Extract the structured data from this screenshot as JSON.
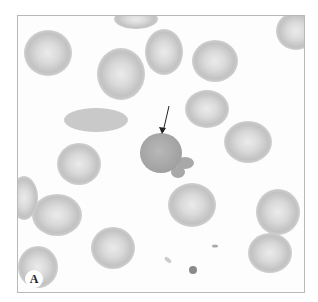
{
  "figure": {
    "panel_label": "A",
    "colors": {
      "background": "#fdfdfd",
      "cell_fill": "#c4c4c4",
      "cell_center": "#e6e6e6",
      "dark_cell": "#a8a8a8",
      "arrow": "#222222",
      "border": "#b8b8b8"
    },
    "cells": [
      {
        "cx": 30,
        "cy": 37,
        "rx": 24,
        "ry": 23,
        "type": "normal"
      },
      {
        "cx": 103,
        "cy": 58,
        "rx": 24,
        "ry": 26,
        "type": "normal"
      },
      {
        "cx": 146,
        "cy": 36,
        "rx": 19,
        "ry": 23,
        "type": "normal"
      },
      {
        "cx": 197,
        "cy": 45,
        "rx": 23,
        "ry": 21,
        "type": "normal"
      },
      {
        "cx": 278,
        "cy": 15,
        "rx": 20,
        "ry": 19,
        "type": "normal"
      },
      {
        "cx": 118,
        "cy": 3,
        "rx": 22,
        "ry": 10,
        "type": "normal"
      },
      {
        "cx": 78,
        "cy": 104,
        "rx": 32,
        "ry": 12,
        "type": "elongated"
      },
      {
        "cx": 189,
        "cy": 93,
        "rx": 22,
        "ry": 19,
        "type": "normal"
      },
      {
        "cx": 230,
        "cy": 126,
        "rx": 24,
        "ry": 21,
        "type": "normal"
      },
      {
        "cx": 61,
        "cy": 148,
        "rx": 22,
        "ry": 21,
        "type": "normal"
      },
      {
        "cx": 174,
        "cy": 189,
        "rx": 24,
        "ry": 22,
        "type": "normal"
      },
      {
        "cx": 39,
        "cy": 199,
        "rx": 25,
        "ry": 21,
        "type": "normal"
      },
      {
        "cx": 6,
        "cy": 182,
        "rx": 14,
        "ry": 22,
        "type": "normal"
      },
      {
        "cx": 260,
        "cy": 196,
        "rx": 22,
        "ry": 23,
        "type": "normal"
      },
      {
        "cx": 252,
        "cy": 237,
        "rx": 22,
        "ry": 20,
        "type": "normal"
      },
      {
        "cx": 95,
        "cy": 232,
        "rx": 22,
        "ry": 21,
        "type": "normal"
      },
      {
        "cx": 20,
        "cy": 251,
        "rx": 20,
        "ry": 21,
        "type": "normal"
      },
      {
        "cx": 155,
        "cy": 290,
        "rx": 19,
        "ry": 10,
        "type": "normal"
      }
    ],
    "target_cell": {
      "cx": 143,
      "cy": 137,
      "rx": 21,
      "ry": 20
    },
    "buds": [
      {
        "cx": 167,
        "cy": 147,
        "rx": 9,
        "ry": 6
      },
      {
        "cx": 160,
        "cy": 156,
        "rx": 7,
        "ry": 6
      }
    ],
    "arrow": {
      "x1": 151,
      "y1": 90,
      "x2": 145,
      "y2": 116
    }
  }
}
